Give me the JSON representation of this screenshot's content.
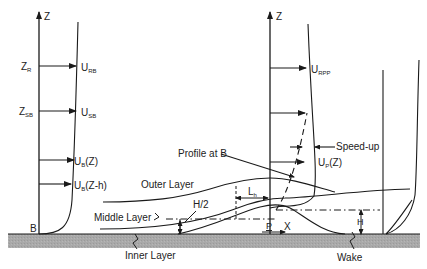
{
  "diagram": {
    "colors": {
      "line": "#1a1a1a",
      "ground": "#a9a9a9",
      "background": "#ffffff"
    },
    "left_profile": {
      "axis_label": "Z",
      "height_labels": [
        {
          "main": "Z",
          "sub": "R"
        },
        {
          "main": "Z",
          "sub": "SB"
        }
      ],
      "velocity_labels": [
        {
          "main": "U",
          "sub": "RB",
          "tail": ""
        },
        {
          "main": "U",
          "sub": "SB",
          "tail": ""
        },
        {
          "main": "U",
          "sub": "B",
          "tail": "(Z)"
        },
        {
          "main": "U",
          "sub": "B",
          "tail": "(Z-h)"
        }
      ],
      "point_label": "B"
    },
    "middle_profile": {
      "axis_label": "Z",
      "velocity_labels": [
        {
          "main": "U",
          "sub": "RPP",
          "tail": ""
        },
        {
          "main": "U",
          "sub": "P",
          "tail": "(Z)"
        }
      ],
      "annotation_speedup": "Speed-up",
      "annotation_profile": "Profile at B",
      "point_label": "P"
    },
    "layers": {
      "outer": "Outer Layer",
      "middle": "Middle Layer",
      "inner": "Inner Layer",
      "wake": "Wake"
    },
    "dimensions": {
      "half_height": "H/2",
      "length": {
        "main": "L",
        "sub": "h"
      },
      "height": "H",
      "x_axis": "X"
    }
  }
}
